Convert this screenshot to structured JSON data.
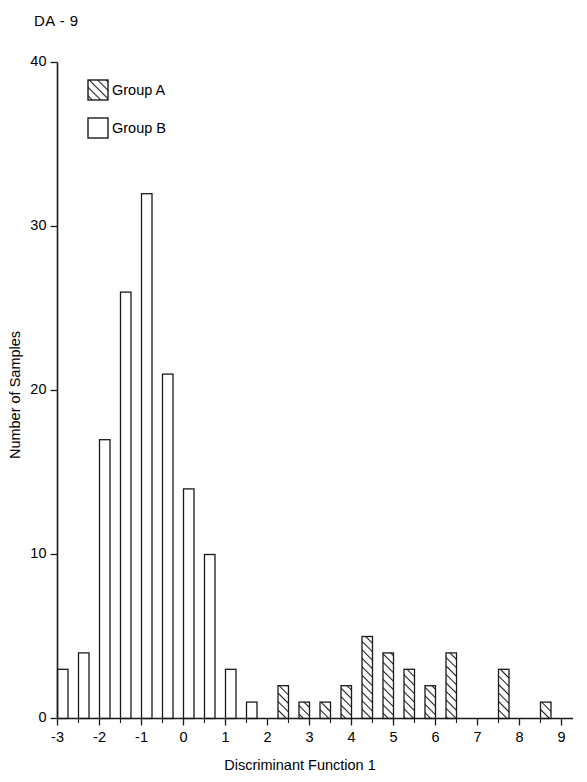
{
  "figure": {
    "title": "DA - 9"
  },
  "legend": {
    "position": "top-left-inside",
    "entries": [
      {
        "label": "Group A",
        "pattern": "diagonal-hatch",
        "color": "#000000"
      },
      {
        "label": "Group B",
        "pattern": "solid-white",
        "color": "#ffffff"
      }
    ]
  },
  "chart_data": {
    "type": "bar",
    "title": "DA - 9",
    "xlabel": "Discriminant Function 1",
    "ylabel": "Number of Samples",
    "xlim": [
      -3.35,
      9.6
    ],
    "ylim": [
      0,
      40
    ],
    "grid": false,
    "bar_width": 0.25,
    "xticks": [
      -3,
      -2,
      -1,
      0,
      1,
      2,
      3,
      4,
      5,
      6,
      7,
      8,
      9
    ],
    "xticklabels": [
      "-3",
      "-2",
      "-1",
      "0",
      "1",
      "2",
      "3",
      "4",
      "5",
      "6",
      "7",
      "8",
      "9"
    ],
    "xminorticks": [
      -2.5,
      -1.5,
      -0.5,
      0.5,
      1.5,
      2.5,
      3.5,
      4.5,
      5.5,
      6.5,
      7.5,
      8.5
    ],
    "yticks": [
      0,
      10,
      20,
      30,
      40
    ],
    "yticklabels": [
      "0",
      "10",
      "20",
      "30",
      "40"
    ],
    "series": [
      {
        "name": "Group B",
        "pattern": "solid-white",
        "bins": [
          -3.0,
          -2.5,
          -2.0,
          -1.5,
          -1.0,
          -0.5,
          0.0,
          0.5,
          1.0,
          1.5
        ],
        "values": [
          3,
          4,
          17,
          26,
          32,
          21,
          14,
          10,
          3,
          1
        ]
      },
      {
        "name": "Group A",
        "pattern": "diagonal-hatch",
        "bins": [
          2.25,
          2.75,
          3.25,
          3.75,
          4.25,
          4.75,
          5.25,
          5.75,
          6.25,
          7.5,
          8.5
        ],
        "values": [
          2,
          1,
          1,
          2,
          5,
          4,
          3,
          2,
          4,
          3,
          1,
          1
        ]
      }
    ]
  }
}
